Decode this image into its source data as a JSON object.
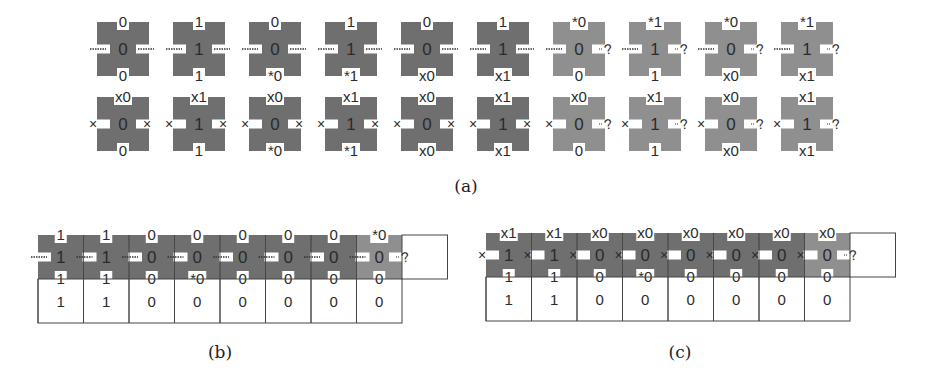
{
  "colors": {
    "tile_dark": "#6f6f6f",
    "tile_light": "#8f8f8f",
    "notch": "#ffffff",
    "text": "#2b2b2b",
    "grid_line": "#555555"
  },
  "panel_a": {
    "caption": "(a)",
    "rows": [
      [
        {
          "shade": "dark",
          "center": "0",
          "top": "0",
          "bottom": "0",
          "left": "dash",
          "right": "dash"
        },
        {
          "shade": "dark",
          "center": "1",
          "top": "1",
          "bottom": "1",
          "left": "dash",
          "right": "dash"
        },
        {
          "shade": "dark",
          "center": "0",
          "top": "0",
          "bottom": "*0",
          "left": "dash",
          "right": "dash"
        },
        {
          "shade": "dark",
          "center": "1",
          "top": "1",
          "bottom": "*1",
          "left": "dash",
          "right": "dash"
        },
        {
          "shade": "dark",
          "center": "0",
          "top": "0",
          "bottom": "x0",
          "left": "dash",
          "right": "dash"
        },
        {
          "shade": "dark",
          "center": "1",
          "top": "1",
          "bottom": "x1",
          "left": "dash",
          "right": "dash"
        },
        {
          "shade": "light",
          "center": "0",
          "top": "*0",
          "bottom": "0",
          "left": "dash",
          "right": "?"
        },
        {
          "shade": "light",
          "center": "1",
          "top": "*1",
          "bottom": "1",
          "left": "dash",
          "right": "?"
        },
        {
          "shade": "light",
          "center": "0",
          "top": "*0",
          "bottom": "x0",
          "left": "dash",
          "right": "?"
        },
        {
          "shade": "light",
          "center": "1",
          "top": "*1",
          "bottom": "x1",
          "left": "dash",
          "right": "?"
        }
      ],
      [
        {
          "shade": "dark",
          "center": "0",
          "top": "x0",
          "bottom": "0",
          "left": "x",
          "right": "x"
        },
        {
          "shade": "dark",
          "center": "1",
          "top": "x1",
          "bottom": "1",
          "left": "x",
          "right": "x"
        },
        {
          "shade": "dark",
          "center": "0",
          "top": "x0",
          "bottom": "*0",
          "left": "x",
          "right": "x"
        },
        {
          "shade": "dark",
          "center": "1",
          "top": "x1",
          "bottom": "*1",
          "left": "x",
          "right": "x"
        },
        {
          "shade": "dark",
          "center": "0",
          "top": "x0",
          "bottom": "x0",
          "left": "x",
          "right": "x"
        },
        {
          "shade": "dark",
          "center": "1",
          "top": "x1",
          "bottom": "x1",
          "left": "x",
          "right": "x"
        },
        {
          "shade": "light",
          "center": "0",
          "top": "x0",
          "bottom": "0",
          "left": "x",
          "right": "?"
        },
        {
          "shade": "light",
          "center": "1",
          "top": "x1",
          "bottom": "1",
          "left": "x",
          "right": "?"
        },
        {
          "shade": "light",
          "center": "0",
          "top": "x0",
          "bottom": "x0",
          "left": "x",
          "right": "?"
        },
        {
          "shade": "light",
          "center": "1",
          "top": "x1",
          "bottom": "x1",
          "left": "x",
          "right": "?"
        }
      ]
    ]
  },
  "panel_b": {
    "caption": "(b)",
    "tiles": [
      {
        "shade": "dark",
        "center": "1",
        "top": "1",
        "bottom": "1",
        "left": "dash"
      },
      {
        "shade": "dark",
        "center": "1",
        "top": "1",
        "bottom": "1",
        "left": "dash"
      },
      {
        "shade": "dark",
        "center": "0",
        "top": "0",
        "bottom": "0",
        "left": "dash"
      },
      {
        "shade": "dark",
        "center": "0",
        "top": "0",
        "bottom": "*0",
        "left": "dash"
      },
      {
        "shade": "dark",
        "center": "0",
        "top": "0",
        "bottom": "0",
        "left": "dash"
      },
      {
        "shade": "dark",
        "center": "0",
        "top": "0",
        "bottom": "0",
        "left": "dash"
      },
      {
        "shade": "dark",
        "center": "0",
        "top": "0",
        "bottom": "0",
        "left": "dash"
      },
      {
        "shade": "light",
        "center": "0",
        "top": "*0",
        "bottom": "0",
        "left": "dash",
        "right": "?"
      }
    ],
    "cells": [
      "1",
      "1",
      "0",
      "0",
      "0",
      "0",
      "0",
      "0"
    ]
  },
  "panel_c": {
    "caption": "(c)",
    "tiles": [
      {
        "shade": "dark",
        "center": "1",
        "top": "x1",
        "bottom": "1",
        "left": "x"
      },
      {
        "shade": "dark",
        "center": "1",
        "top": "x1",
        "bottom": "1",
        "left": "x"
      },
      {
        "shade": "dark",
        "center": "0",
        "top": "x0",
        "bottom": "0",
        "left": "x"
      },
      {
        "shade": "dark",
        "center": "0",
        "top": "x0",
        "bottom": "*0",
        "left": "x"
      },
      {
        "shade": "dark",
        "center": "0",
        "top": "x0",
        "bottom": "0",
        "left": "x"
      },
      {
        "shade": "dark",
        "center": "0",
        "top": "x0",
        "bottom": "0",
        "left": "x"
      },
      {
        "shade": "dark",
        "center": "0",
        "top": "x0",
        "bottom": "0",
        "left": "x"
      },
      {
        "shade": "light",
        "center": "0",
        "top": "x0",
        "bottom": "0",
        "left": "x",
        "right": "?"
      }
    ],
    "cells": [
      "1",
      "1",
      "0",
      "0",
      "0",
      "0",
      "0",
      "0"
    ]
  }
}
